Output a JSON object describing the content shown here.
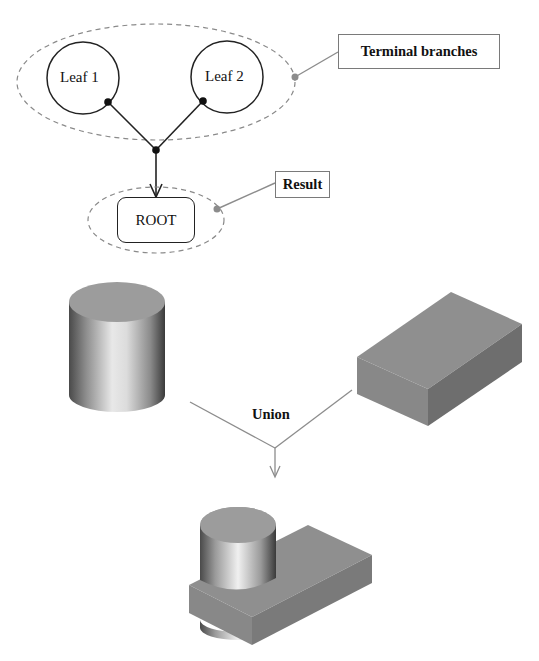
{
  "tree": {
    "leaves": [
      {
        "label": "Leaf 1"
      },
      {
        "label": "Leaf 2"
      }
    ],
    "root": {
      "label": "ROOT"
    },
    "callouts": {
      "terminal": "Terminal branches",
      "result": "Result"
    }
  },
  "operation": {
    "label": "Union",
    "inputs": [
      "cylinder",
      "box"
    ],
    "output": "cylinder-box-union"
  },
  "colors": {
    "line": "#222222",
    "dashed": "#8a8a8a",
    "callout_line": "#8c8c8c",
    "solid_top": "#9a9a9a",
    "solid_side": "#7d7d7d"
  }
}
